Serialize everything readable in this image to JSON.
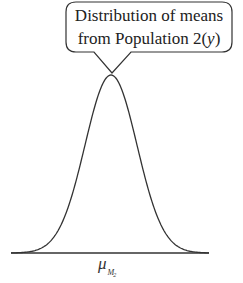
{
  "callout": {
    "line1": "Distribution of means",
    "line2_prefix": "from Population 2(",
    "line2_var": "y",
    "line2_suffix": ")"
  },
  "axis_label": {
    "symbol": "μ",
    "subscript": "M",
    "subsubscript": "2"
  },
  "colors": {
    "stroke": "#333333",
    "background": "#ffffff"
  },
  "chart_data": {
    "type": "line",
    "title": "Distribution of means from Population 2(y)",
    "xlabel": "μ_M2",
    "ylabel": "",
    "center_label": "μ_M2",
    "distribution": "normal",
    "grid": false,
    "legend": "none",
    "annotations": [
      "Distribution of means from Population 2(y)"
    ]
  }
}
